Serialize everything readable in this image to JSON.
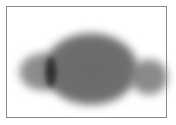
{
  "image": {
    "description": "Blurred grayscale silhouette with a large central oval mass, smaller left and right lobes, and a dark vertical spot on the left side, inside a thin gray frame",
    "colors": {
      "frame": "#8a8a8a",
      "mass": "#6e6e6e",
      "lobes": "#8c8c8c",
      "dark_spot": "#2a2a2a",
      "background": "#ffffff"
    }
  }
}
